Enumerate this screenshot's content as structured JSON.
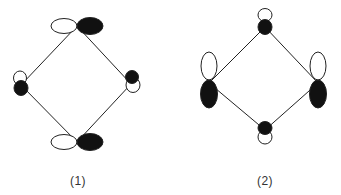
{
  "colors": {
    "line": "#222222",
    "filled_lobe": "#111111",
    "empty_lobe": "#ffffff",
    "label": "#333333"
  },
  "diagrams": [
    {
      "label": "(1)",
      "label_pos": [
        78,
        174
      ],
      "vertices": {
        "top": [
          77,
          26
        ],
        "left": [
          21,
          85
        ],
        "right": [
          131,
          84
        ],
        "bottom": [
          77,
          142
        ]
      },
      "orbitals": [
        {
          "name": "top-orbital",
          "lobes": [
            {
              "cx": 64,
              "cy": 26,
              "rx": 13,
              "ry": 7.5,
              "fill": "empty"
            },
            {
              "cx": 90,
              "cy": 26,
              "rx": 13,
              "ry": 8.5,
              "fill": "filled"
            }
          ]
        },
        {
          "name": "left-orbital",
          "lobes": [
            {
              "cx": 20,
              "cy": 78,
              "rx": 6.5,
              "ry": 7,
              "fill": "empty"
            },
            {
              "cx": 21,
              "cy": 88,
              "rx": 7,
              "ry": 7.5,
              "fill": "filled"
            }
          ]
        },
        {
          "name": "right-orbital",
          "lobes": [
            {
              "cx": 132,
              "cy": 77,
              "rx": 6.5,
              "ry": 6.5,
              "fill": "filled"
            },
            {
              "cx": 133,
              "cy": 85,
              "rx": 7,
              "ry": 7.5,
              "fill": "empty"
            }
          ]
        },
        {
          "name": "bottom-orbital",
          "lobes": [
            {
              "cx": 64,
              "cy": 142,
              "rx": 13,
              "ry": 7.5,
              "fill": "empty"
            },
            {
              "cx": 90,
              "cy": 142,
              "rx": 13,
              "ry": 8.5,
              "fill": "filled"
            }
          ]
        }
      ]
    },
    {
      "label": "(2)",
      "label_pos": [
        265,
        174
      ],
      "vertices": {
        "top": [
          265,
          27
        ],
        "left": [
          209,
          83
        ],
        "right": [
          318,
          83
        ],
        "bottom": [
          265,
          130
        ]
      },
      "orbitals": [
        {
          "name": "top-orbital",
          "lobes": [
            {
              "cx": 265,
              "cy": 15,
              "rx": 7,
              "ry": 6.5,
              "fill": "empty"
            },
            {
              "cx": 265,
              "cy": 27,
              "rx": 7,
              "ry": 7.5,
              "fill": "filled"
            }
          ]
        },
        {
          "name": "left-orbital",
          "lobes": [
            {
              "cx": 209,
              "cy": 66,
              "rx": 8,
              "ry": 14,
              "fill": "empty"
            },
            {
              "cx": 209,
              "cy": 94,
              "rx": 8.5,
              "ry": 14,
              "fill": "filled"
            }
          ]
        },
        {
          "name": "right-orbital",
          "lobes": [
            {
              "cx": 318,
              "cy": 66,
              "rx": 8,
              "ry": 14,
              "fill": "empty"
            },
            {
              "cx": 318,
              "cy": 94,
              "rx": 8.5,
              "ry": 14,
              "fill": "filled"
            }
          ]
        },
        {
          "name": "bottom-orbital",
          "lobes": [
            {
              "cx": 265,
              "cy": 128,
              "rx": 7,
              "ry": 6.5,
              "fill": "filled"
            },
            {
              "cx": 265,
              "cy": 137,
              "rx": 7,
              "ry": 7,
              "fill": "empty"
            }
          ]
        }
      ]
    }
  ]
}
